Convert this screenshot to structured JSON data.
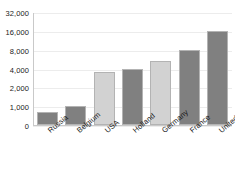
{
  "chart_data": {
    "type": "bar",
    "title": "",
    "subtitle": "",
    "xlabel": "",
    "ylabel": "",
    "yscale": "log2-like (evenly spaced doublings)",
    "categories": [
      "Russia",
      "Belgium",
      "USA",
      "Holland",
      "Germany",
      "France",
      "United Kingdom"
    ],
    "values": [
      700,
      1000,
      3500,
      4000,
      5200,
      8000,
      16000
    ],
    "ytick_labels": [
      "32,000",
      "16,000",
      "8,000",
      "4,000",
      "2,000",
      "1,000",
      "0"
    ],
    "ytick_values": [
      32000,
      16000,
      8000,
      4000,
      2000,
      1000,
      0
    ],
    "ylim": [
      0,
      32000
    ],
    "grid": true,
    "legend": "none",
    "bar_colors": [
      "#808080",
      "#808080",
      "#d2d2d2",
      "#808080",
      "#d2d2d2",
      "#808080",
      "#808080"
    ]
  },
  "colors": {
    "bar_dark": "#808080",
    "bar_light": "#d2d2d2",
    "bar_border": "#b3b3b3",
    "gridline": "#ececec",
    "axis": "#c9c9c9",
    "text": "#1a1a1a",
    "background": "#ffffff"
  }
}
